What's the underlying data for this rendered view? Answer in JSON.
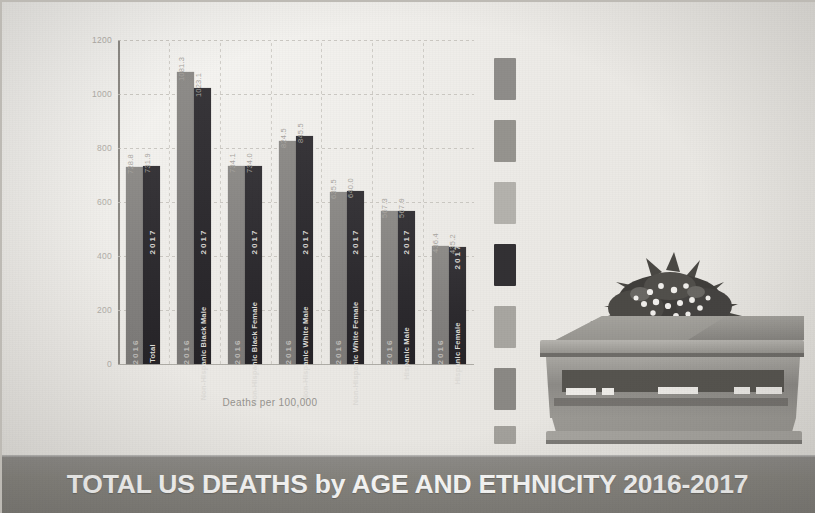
{
  "banner": {
    "title": "TOTAL US DEATHS by AGE AND ETHNICITY 2016-2017"
  },
  "chart_data": {
    "type": "bar",
    "title": "TOTAL US DEATHS by AGE AND ETHNICITY 2016-2017",
    "xlabel": "Deaths per 100,000",
    "ylabel": "",
    "ylim": [
      0,
      1200
    ],
    "grid": true,
    "legend_position": "in-bar",
    "categories": [
      "Total",
      "Non-Hispanic Black Male",
      "Non-Hispanic Black Female",
      "Non-Hispanic White Male",
      "Non-Hispanic White Female",
      "Hispanic Male",
      "Hispanic Female"
    ],
    "yticks": [
      0,
      200,
      400,
      600,
      800,
      1000,
      1200
    ],
    "ytick_labels": [
      "0",
      "200",
      "400",
      "600",
      "800",
      "1000",
      "1200"
    ],
    "series": [
      {
        "name": "2016",
        "color": "#858381",
        "values": [
          728.8,
          1081.3,
          734.1,
          824.5,
          635.5,
          567.3,
          436.4
        ],
        "value_labels": [
          "728.8",
          "1081.3",
          "734.1",
          "824.5",
          "635.5",
          "567.3",
          "436.4"
        ]
      },
      {
        "name": "2017",
        "color": "#2e2c30",
        "values": [
          731.9,
          1023.1,
          734.0,
          845.5,
          640.0,
          567.9,
          435.2
        ],
        "value_labels": [
          "731.9",
          "1023.1",
          "734.0",
          "845.5",
          "640.0",
          "567.9",
          "435.2"
        ]
      }
    ]
  },
  "divider": {
    "name": "dashed-vertical-divider",
    "dashes": [
      {
        "color": "#8f8d8a",
        "top": 0,
        "height": 42
      },
      {
        "color": "#96948f",
        "top": 62,
        "height": 42
      },
      {
        "color": "#b4b2ad",
        "top": 124,
        "height": 42
      },
      {
        "color": "#333134",
        "top": 186,
        "height": 42
      },
      {
        "color": "#a8a6a1",
        "top": 248,
        "height": 42
      },
      {
        "color": "#8b8985",
        "top": 310,
        "height": 42
      },
      {
        "color": "#a3a19c",
        "top": 368,
        "height": 18
      }
    ]
  },
  "illustration": {
    "name": "casket-with-flowers-and-flag",
    "caption": ""
  }
}
